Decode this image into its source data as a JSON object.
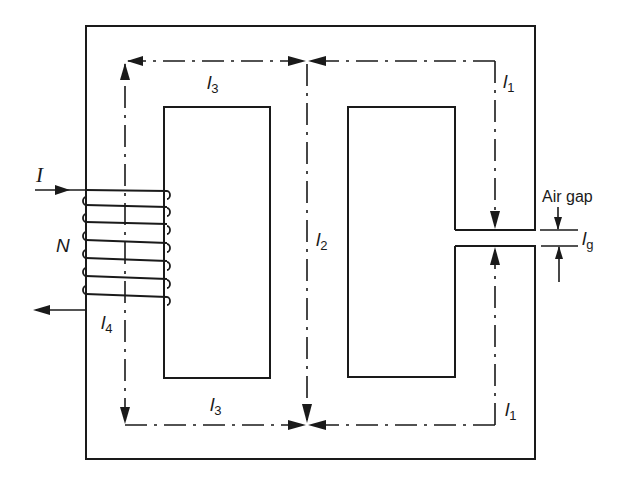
{
  "diagram": {
    "core": {
      "outer_left": 86,
      "outer_top": 26,
      "outer_right": 535,
      "outer_bottom": 459,
      "left_window": {
        "x1": 164,
        "y1": 107,
        "x2": 270,
        "y2": 378
      },
      "right_window": {
        "x1": 348,
        "y1": 107,
        "x2": 455,
        "y2": 377
      },
      "gap": {
        "y_top": 230,
        "y_bottom": 246
      }
    },
    "mean_path": {
      "left_x": 125,
      "top_y": 61,
      "mid_x": 307,
      "right_x": 495,
      "bottom_y": 425
    },
    "coil": {
      "turns_label": "N",
      "current_label": "I"
    },
    "labels": {
      "l1_top": {
        "base": "l",
        "sub": "1"
      },
      "l1_bottom": {
        "base": "l",
        "sub": "1"
      },
      "l2": {
        "base": "l",
        "sub": "2"
      },
      "l3_top": {
        "base": "l",
        "sub": "3"
      },
      "l3_bottom": {
        "base": "l",
        "sub": "3"
      },
      "l4": {
        "base": "l",
        "sub": "4"
      },
      "lg": {
        "base": "l",
        "sub": "g"
      },
      "air_gap": "Air gap"
    }
  }
}
